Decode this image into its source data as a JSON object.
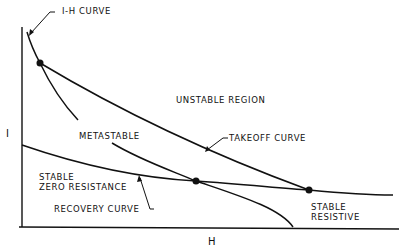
{
  "diagram": {
    "axes": {
      "x_label": "H",
      "y_label": "I"
    },
    "labels": {
      "ih_curve": "I-H CURVE",
      "unstable_region": "UNSTABLE REGION",
      "metastable": "METASTABLE",
      "takeoff_curve": "TAKEOFF CURVE",
      "stable_zero_line1": "STABLE",
      "stable_zero_line2": "ZERO RESISTANCE",
      "recovery_curve": "RECOVERY CURVE",
      "stable_resistive_line1": "STABLE",
      "stable_resistive_line2": "RESISTIVE"
    },
    "points": [
      {
        "name": "ih-takeoff-intersection",
        "x": 40,
        "y": 63
      },
      {
        "name": "ih-recovery-intersection",
        "x": 196,
        "y": 181
      },
      {
        "name": "takeoff-recovery-intersection",
        "x": 309,
        "y": 190
      }
    ],
    "line_color": "#111111"
  }
}
